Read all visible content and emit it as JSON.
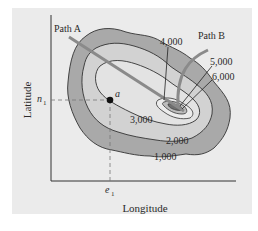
{
  "diagram": {
    "axes": {
      "x_label": "Longitude",
      "y_label": "Latitude"
    },
    "markers": {
      "x_tick": "e",
      "x_tick_sub": "1",
      "y_tick": "n",
      "y_tick_sub": "1",
      "point_label": "a"
    },
    "paths": [
      {
        "label": "Path A"
      },
      {
        "label": "Path B"
      }
    ],
    "contours": [
      {
        "label": "1,000"
      },
      {
        "label": "2,000"
      },
      {
        "label": "3,000"
      },
      {
        "label": "4,000"
      },
      {
        "label": "5,000"
      },
      {
        "label": "6,000"
      }
    ],
    "colors": {
      "background": "#ebebeb",
      "band_1000": "#a9a9a9",
      "band_2000": "#d2d2d2",
      "band_3000": "#e3e3e3",
      "path_line": "#8a8a8a",
      "ink": "#2a2a2a"
    }
  }
}
